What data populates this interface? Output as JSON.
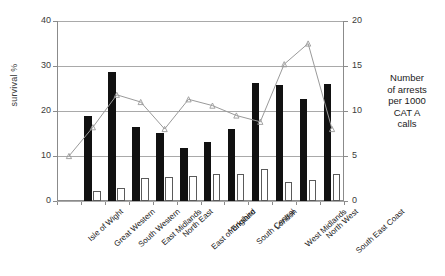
{
  "chart_data": {
    "type": "bar",
    "title": "",
    "subtitle": "",
    "xlabel": "",
    "ylabel": "survival %",
    "ylabel_right": "Number of arrests per 1000 CAT A calls",
    "ylim": [
      0,
      40
    ],
    "ylim_right": [
      0,
      20
    ],
    "yticks": [
      0,
      10,
      20,
      30,
      40
    ],
    "yticks_right": [
      0,
      5,
      10,
      15,
      20
    ],
    "grid": true,
    "legend_position": "none",
    "categories": [
      "Isle of Wight",
      "Great Western",
      "South Western",
      "East Midlands",
      "North East",
      "East of England",
      "Yorkshire",
      "South Central",
      "London",
      "West Midlands",
      "North West",
      "South East Coast"
    ],
    "series": [
      {
        "name": "survival %",
        "type": "bar",
        "color": "#111111",
        "axis": "left",
        "values": [
          null,
          19.0,
          28.7,
          16.5,
          15.2,
          11.8,
          13.1,
          16.1,
          26.3,
          25.8,
          22.7,
          26.0
        ]
      },
      {
        "name": "secondary bar",
        "type": "bar",
        "color": "#ffffff",
        "axis": "left",
        "values": [
          null,
          2.2,
          3.0,
          5.1,
          5.3,
          5.6,
          6.0,
          6.1,
          7.1,
          4.2,
          4.6,
          6.0
        ]
      },
      {
        "name": "Number of arrests per 1000 CAT A calls",
        "type": "line",
        "color": "#9a9a9a",
        "axis": "right",
        "values": [
          5.0,
          8.2,
          11.8,
          11.0,
          8.0,
          11.3,
          10.6,
          9.5,
          8.8,
          15.2,
          17.5,
          8.0
        ]
      }
    ]
  },
  "axis_right_label_lines": [
    "Number",
    "of arrests",
    "per 1000",
    "CAT A",
    "calls"
  ]
}
